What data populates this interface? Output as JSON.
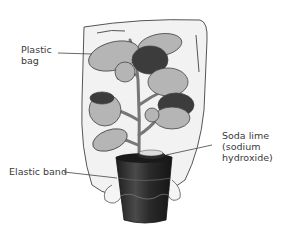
{
  "labels": {
    "plastic_bag": "Plastic\nbag",
    "soda_lime": "Soda lime\n(sodium\nhydroxide)",
    "elastic_band": "Elastic band"
  },
  "colors": {
    "bag_fill": "#f2f2f2",
    "bag_stroke": "#555555",
    "leaf_light": "#b5b5b5",
    "leaf_dark": "#3c3c3c",
    "pot": "#2e2e2e",
    "text": "#3a3a3a"
  }
}
